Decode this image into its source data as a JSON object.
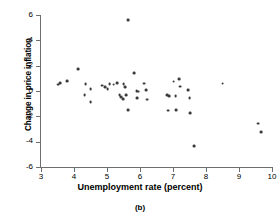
{
  "figure": {
    "caption": "(b)"
  },
  "chart_data": {
    "type": "scatter",
    "title": "",
    "xlabel": "Unemployment rate (percent)",
    "ylabel": "Change in price inflation",
    "xlim": [
      3,
      10
    ],
    "ylim": [
      -6,
      6
    ],
    "xticks": [
      3,
      4,
      5,
      6,
      7,
      8,
      9,
      10
    ],
    "yticks": [
      -6,
      -4,
      -2,
      0,
      2,
      4,
      6
    ],
    "xtick_labels": [
      "3",
      "4",
      "5",
      "6",
      "7",
      "8",
      "9",
      "10"
    ],
    "ytick_labels": [
      "-6",
      "-4",
      "-2",
      "0",
      "2",
      "4",
      "6"
    ],
    "grid": false,
    "legend": null,
    "marker": {
      "shape": "circle",
      "color": "#3a3a3a",
      "size": 3
    },
    "points": [
      {
        "x": 3.52,
        "y": 0.5
      },
      {
        "x": 3.58,
        "y": 0.62
      },
      {
        "x": 3.78,
        "y": 0.78
      },
      {
        "x": 4.12,
        "y": 1.7
      },
      {
        "x": 4.35,
        "y": 0.55
      },
      {
        "x": 4.32,
        "y": -0.35
      },
      {
        "x": 4.5,
        "y": 0.12
      },
      {
        "x": 4.5,
        "y": -0.88
      },
      {
        "x": 4.85,
        "y": 0.42
      },
      {
        "x": 4.95,
        "y": 0.3
      },
      {
        "x": 5.02,
        "y": 0.18
      },
      {
        "x": 5.08,
        "y": 0.55
      },
      {
        "x": 5.2,
        "y": 0.5
      },
      {
        "x": 5.3,
        "y": 0.62
      },
      {
        "x": 5.38,
        "y": -0.3
      },
      {
        "x": 5.42,
        "y": -0.48
      },
      {
        "x": 5.48,
        "y": -0.62
      },
      {
        "x": 5.5,
        "y": 0.55
      },
      {
        "x": 5.55,
        "y": 0.3
      },
      {
        "x": 5.58,
        "y": -0.3
      },
      {
        "x": 5.65,
        "y": 5.6
      },
      {
        "x": 5.65,
        "y": -1.48
      },
      {
        "x": 5.82,
        "y": 1.42
      },
      {
        "x": 5.9,
        "y": 0.0
      },
      {
        "x": 5.95,
        "y": -0.05
      },
      {
        "x": 5.92,
        "y": -0.55
      },
      {
        "x": 6.12,
        "y": 0.58
      },
      {
        "x": 6.18,
        "y": 0.08
      },
      {
        "x": 6.22,
        "y": -0.68
      },
      {
        "x": 6.82,
        "y": -0.32
      },
      {
        "x": 6.88,
        "y": -0.38
      },
      {
        "x": 6.85,
        "y": -1.55
      },
      {
        "x": 7.02,
        "y": 0.75
      },
      {
        "x": 7.08,
        "y": -0.42
      },
      {
        "x": 7.1,
        "y": -1.5
      },
      {
        "x": 7.18,
        "y": 0.95
      },
      {
        "x": 7.22,
        "y": 0.35
      },
      {
        "x": 7.45,
        "y": 0.08
      },
      {
        "x": 7.5,
        "y": -0.58
      },
      {
        "x": 7.52,
        "y": -1.72
      },
      {
        "x": 7.65,
        "y": -4.35
      },
      {
        "x": 8.5,
        "y": 0.58
      },
      {
        "x": 9.58,
        "y": -2.58
      },
      {
        "x": 9.68,
        "y": -3.25
      }
    ]
  }
}
